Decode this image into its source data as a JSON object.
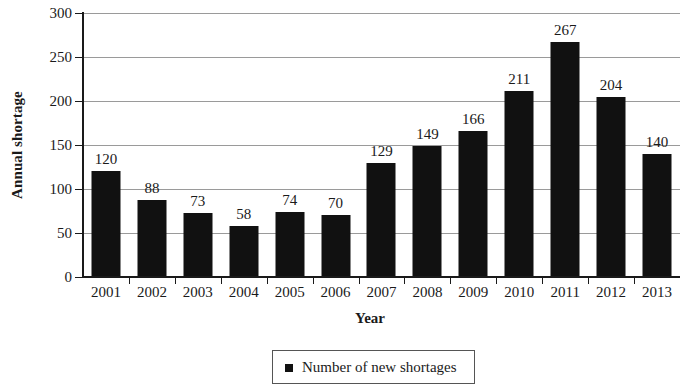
{
  "chart_data": {
    "type": "bar",
    "title": "",
    "xlabel": "Year",
    "ylabel": "Annual shortage",
    "categories": [
      "2001",
      "2002",
      "2003",
      "2004",
      "2005",
      "2006",
      "2007",
      "2008",
      "2009",
      "2010",
      "2011",
      "2012",
      "2013"
    ],
    "values": [
      120,
      88,
      73,
      58,
      74,
      70,
      129,
      149,
      166,
      211,
      267,
      204,
      140
    ],
    "series": [
      {
        "name": "Number of new shortages",
        "values": [
          120,
          88,
          73,
          58,
          74,
          70,
          129,
          149,
          166,
          211,
          267,
          204,
          140
        ]
      }
    ],
    "ylim": [
      0,
      300
    ],
    "yticks": [
      0,
      50,
      100,
      150,
      200,
      250,
      300
    ],
    "ytick_labels": [
      "0",
      "50",
      "100",
      "150",
      "200",
      "250",
      "300"
    ],
    "grid": true,
    "grid_axis": "y",
    "legend": {
      "position": "bottom",
      "entries": [
        {
          "label": "Number of new shortages",
          "marker": "square",
          "color": "#111111"
        }
      ]
    },
    "bar_color": "#111111",
    "gridline_color": "#9a9a9a",
    "axis_color": "#1a1a1a",
    "data_labels": true
  },
  "axes": {
    "y_title": "Annual shortage",
    "x_title": "Year"
  },
  "legend": {
    "entry_label": "Number of new shortages"
  }
}
